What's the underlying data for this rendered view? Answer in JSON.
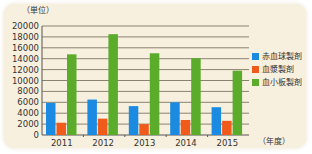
{
  "chart_data": {
    "type": "bar",
    "title": "",
    "ylabel": "（単位）",
    "xlabel": "（年度）",
    "categories": [
      "2011",
      "2012",
      "2013",
      "2014",
      "2015"
    ],
    "ylim": [
      0,
      20000
    ],
    "yticks": [
      0,
      2000,
      4000,
      6000,
      8000,
      10000,
      12000,
      14000,
      16000,
      18000,
      20000
    ],
    "grid": true,
    "legend_position": "right",
    "series": [
      {
        "name": "赤血球製剤",
        "color": "#1a8be0",
        "values": [
          5900,
          6500,
          5300,
          6000,
          5100
        ]
      },
      {
        "name": "血漿製剤",
        "color": "#f05a1a",
        "values": [
          2250,
          3000,
          2000,
          2750,
          2600
        ]
      },
      {
        "name": "血小板製剤",
        "color": "#5aac2a",
        "values": [
          14800,
          18500,
          15000,
          14100,
          11800
        ]
      }
    ]
  }
}
